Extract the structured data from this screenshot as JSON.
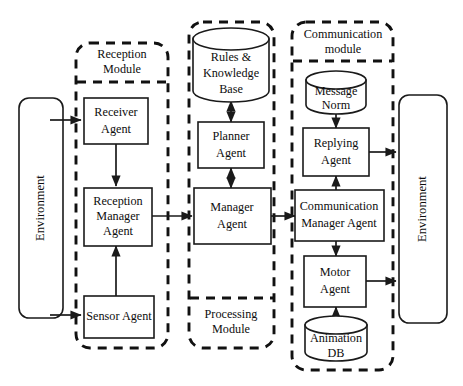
{
  "diagram": {
    "colors": {
      "background": "#ffffff",
      "stroke": "#1a1a1a",
      "dashed_stroke": "#111111",
      "text": "#0d0d0d"
    },
    "environments": [
      {
        "id": "env-left",
        "label": "Environment",
        "orientation": "vertical"
      },
      {
        "id": "env-right",
        "label": "Environment",
        "orientation": "vertical"
      }
    ],
    "modules": [
      {
        "id": "reception-module",
        "label_line1": "Reception",
        "label_line2": "Module",
        "label_position": "top"
      },
      {
        "id": "processing-module",
        "label_line1": "Processing",
        "label_line2": "Module",
        "label_position": "bottom"
      },
      {
        "id": "communication-module",
        "label_line1": "Communication",
        "label_line2": "module",
        "label_position": "top"
      }
    ],
    "nodes": [
      {
        "id": "receiver-agent",
        "shape": "rect",
        "line1": "Receiver",
        "line2": "Agent",
        "module": "reception-module"
      },
      {
        "id": "reception-manager-agent",
        "shape": "rect",
        "line1": "Reception",
        "line2": "Manager",
        "line3": "Agent",
        "module": "reception-module"
      },
      {
        "id": "sensor-agent",
        "shape": "rect",
        "line1": "Sensor Agent",
        "module": "reception-module"
      },
      {
        "id": "rules-knowledge-base",
        "shape": "cylinder",
        "line1": "Rules &",
        "line2": "Knowledge",
        "line3": "Base",
        "module": "processing-module"
      },
      {
        "id": "planner-agent",
        "shape": "rect",
        "line1": "Planner",
        "line2": "Agent",
        "module": "processing-module"
      },
      {
        "id": "manager-agent",
        "shape": "rect",
        "line1": "Manager",
        "line2": "Agent",
        "module": "processing-module"
      },
      {
        "id": "message-norm",
        "shape": "cylinder",
        "line1": "Message",
        "line2": "Norm",
        "module": "communication-module"
      },
      {
        "id": "replying-agent",
        "shape": "rect",
        "line1": "Replying",
        "line2": "Agent",
        "module": "communication-module"
      },
      {
        "id": "communication-manager-agent",
        "shape": "rect",
        "line1": "Communication",
        "line2": "Manager Agent",
        "module": "communication-module"
      },
      {
        "id": "motor-agent",
        "shape": "rect",
        "line1": "Motor",
        "line2": "Agent",
        "module": "communication-module"
      },
      {
        "id": "animation-db",
        "shape": "cylinder",
        "line1": "Animation",
        "line2": "DB",
        "module": "communication-module"
      }
    ],
    "connections": [
      {
        "id": "env-left-to-receiver",
        "from": "env-left",
        "to": "receiver-agent",
        "arrow": "single"
      },
      {
        "id": "env-left-to-sensor",
        "from": "env-left",
        "to": "sensor-agent",
        "arrow": "single"
      },
      {
        "id": "receiver-to-reception-manager",
        "from": "receiver-agent",
        "to": "reception-manager-agent",
        "arrow": "single"
      },
      {
        "id": "sensor-to-reception-manager",
        "from": "sensor-agent",
        "to": "reception-manager-agent",
        "arrow": "single"
      },
      {
        "id": "reception-manager-to-manager",
        "from": "reception-manager-agent",
        "to": "manager-agent",
        "arrow": "single"
      },
      {
        "id": "rules-base-to-planner",
        "from": "rules-knowledge-base",
        "to": "planner-agent",
        "arrow": "double"
      },
      {
        "id": "planner-to-manager",
        "from": "planner-agent",
        "to": "manager-agent",
        "arrow": "double"
      },
      {
        "id": "manager-to-communication-manager",
        "from": "manager-agent",
        "to": "communication-manager-agent",
        "arrow": "single"
      },
      {
        "id": "message-norm-to-replying",
        "from": "message-norm",
        "to": "replying-agent",
        "arrow": "single"
      },
      {
        "id": "communication-manager-to-replying",
        "from": "communication-manager-agent",
        "to": "replying-agent",
        "arrow": "single"
      },
      {
        "id": "replying-to-env-right",
        "from": "replying-agent",
        "to": "env-right",
        "arrow": "single"
      },
      {
        "id": "communication-manager-to-motor",
        "from": "communication-manager-agent",
        "to": "motor-agent",
        "arrow": "single"
      },
      {
        "id": "animation-db-to-motor",
        "from": "animation-db",
        "to": "motor-agent",
        "arrow": "single"
      },
      {
        "id": "motor-to-env-right",
        "from": "motor-agent",
        "to": "env-right",
        "arrow": "single"
      }
    ]
  }
}
